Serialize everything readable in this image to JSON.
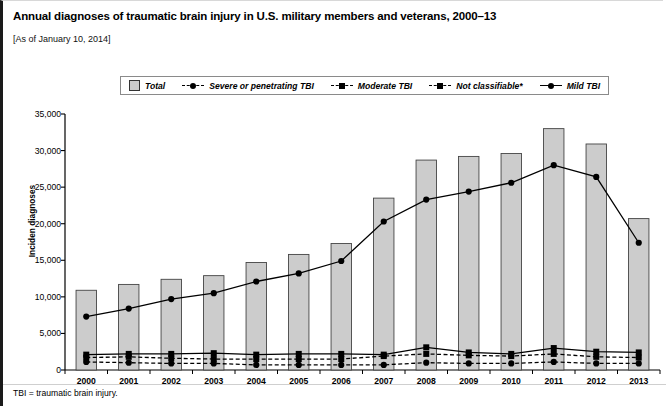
{
  "title": "Annual diagnoses of traumatic brain injury in U.S. military members and veterans, 2000–13",
  "subtitle": "[As of January 10, 2014]",
  "footnote": "TBI = traumatic brain injury.",
  "legend": {
    "items": [
      {
        "label": "Total",
        "marker": "box",
        "style": "solid"
      },
      {
        "label": "Severe or penetrating TBI",
        "marker": "circle",
        "style": "dashed"
      },
      {
        "label": "Moderate TBI",
        "marker": "square",
        "style": "dashed"
      },
      {
        "label": "Not classifiable*",
        "marker": "square",
        "style": "dashed"
      },
      {
        "label": "Mild TBI",
        "marker": "circle",
        "style": "solid"
      }
    ]
  },
  "colors": {
    "bar_fill": "#cccccc",
    "bar_stroke": "#444444",
    "line": "#000000",
    "axis": "#000000",
    "frame_border": "#1a1a1a"
  },
  "chart_data": {
    "type": "bar",
    "title": "Annual diagnoses of traumatic brain injury in U.S. military members and veterans, 2000–13",
    "xlabel": "",
    "ylabel": "Inciden diagnoses",
    "categories": [
      "2000",
      "2001",
      "2002",
      "2003",
      "2004",
      "2005",
      "2006",
      "2007",
      "2008",
      "2009",
      "2010",
      "2011",
      "2012",
      "2013"
    ],
    "ylim": [
      0,
      35000
    ],
    "yticks": [
      "0",
      "5,000",
      "10,000",
      "15,000",
      "20,000",
      "25,000",
      "30,000",
      "35,000"
    ],
    "ytick_values": [
      0,
      5000,
      10000,
      15000,
      20000,
      25000,
      30000,
      35000
    ],
    "grid": false,
    "legend_position": "top-center",
    "series": [
      {
        "name": "Total",
        "type": "bar",
        "values": [
          10900,
          11700,
          12400,
          12900,
          14700,
          15800,
          17300,
          23500,
          28700,
          29200,
          29600,
          33000,
          30900,
          20700
        ]
      },
      {
        "name": "Mild TBI",
        "type": "line",
        "style": "solid",
        "marker": "circle",
        "values": [
          7300,
          8400,
          9700,
          10500,
          12100,
          13200,
          14900,
          20300,
          23300,
          24400,
          25600,
          28000,
          26400,
          17400
        ]
      },
      {
        "name": "Moderate TBI",
        "type": "line",
        "style": "solid",
        "marker": "square",
        "values": [
          2100,
          2200,
          2200,
          2300,
          2100,
          2200,
          2200,
          2100,
          3100,
          2400,
          2200,
          3000,
          2500,
          2400
        ]
      },
      {
        "name": "Severe or penetrating TBI",
        "type": "line",
        "style": "dashed",
        "marker": "circle",
        "values": [
          1100,
          1000,
          900,
          900,
          700,
          700,
          700,
          700,
          1000,
          900,
          900,
          1100,
          900,
          900
        ]
      },
      {
        "name": "Not classifiable*",
        "type": "line",
        "style": "dashed",
        "marker": "square",
        "values": [
          1700,
          1800,
          1600,
          1500,
          1500,
          1500,
          1500,
          1900,
          2200,
          2000,
          1900,
          2200,
          1800,
          1700
        ]
      }
    ]
  }
}
